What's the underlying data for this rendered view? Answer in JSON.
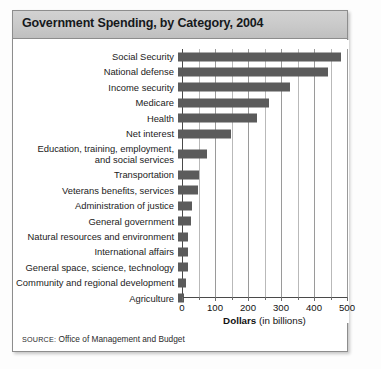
{
  "card": {
    "title": "Government Spending, by Category, 2004",
    "source_prefix": "SOURCE:",
    "source_text": " Office of Management and Budget"
  },
  "axis": {
    "title_bold": "Dollars",
    "title_rest": " (in billions)",
    "tick_labels": [
      "0",
      "100",
      "200",
      "300",
      "400",
      "500"
    ]
  },
  "colors": {
    "bar": "#5b5b5b",
    "title_band": "#c9c9c9",
    "frame": "#8d8d8d",
    "gridline": "#b9b9b9"
  },
  "chart_data": {
    "type": "bar",
    "orientation": "horizontal",
    "title": "Government Spending, by Category, 2004",
    "xlabel": "Dollars (in billions)",
    "ylabel": "",
    "xlim": [
      0,
      500
    ],
    "xticks": [
      0,
      100,
      200,
      300,
      400,
      500
    ],
    "minor_xticks": [
      50,
      150,
      250,
      350,
      450
    ],
    "grid": "vertical",
    "legend": "none",
    "units": "billions of dollars",
    "source": "SOURCE: Office of Management and Budget",
    "categories": [
      "Social Security",
      "National defense",
      "Income security",
      "Medicare",
      "Health",
      "Net interest",
      "Education, training, employment,\nand social services",
      "Transportation",
      "Veterans benefits, services",
      "Administration of justice",
      "General government",
      "Natural resources and environment",
      "International affairs",
      "General space, science, technology",
      "Community and regional development",
      "Agriculture"
    ],
    "values": [
      495,
      455,
      340,
      275,
      240,
      160,
      88,
      65,
      60,
      42,
      40,
      31,
      30,
      29,
      25,
      18
    ]
  }
}
